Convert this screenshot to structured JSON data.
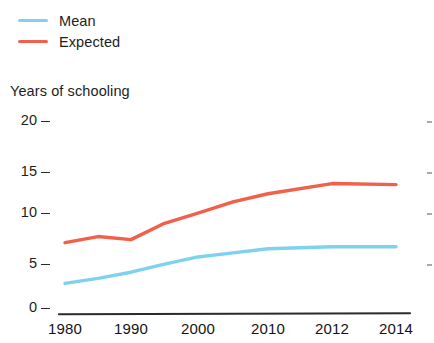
{
  "chart_data": {
    "type": "line",
    "title": "",
    "ylabel": "Years of schooling",
    "xlabel": "",
    "ylim": [
      0,
      20
    ],
    "yticks": [
      0,
      5,
      10,
      15,
      20
    ],
    "ytick_labels": [
      "0",
      "5",
      "10",
      "15",
      "20"
    ],
    "x": [
      1980,
      1985,
      1990,
      1995,
      2000,
      2005,
      2010,
      2012,
      2014
    ],
    "xticks": [
      1980,
      1990,
      2000,
      2010,
      2012,
      2014
    ],
    "xtick_labels": [
      "1980",
      "1990",
      "2000",
      "2010",
      "2012",
      "2014"
    ],
    "grid": false,
    "legend_position": "top-left",
    "series": [
      {
        "name": "Mean",
        "color": "#7ed2ee",
        "values": [
          3.0,
          3.5,
          4.1,
          4.9,
          5.6,
          6.0,
          6.4,
          6.6,
          6.6
        ]
      },
      {
        "name": "Expected",
        "color": "#f0604a",
        "values": [
          7.0,
          7.6,
          7.3,
          8.9,
          9.9,
          11.0,
          11.8,
          12.8,
          12.7
        ]
      }
    ]
  },
  "legend": {
    "items": [
      {
        "label": "Mean",
        "color": "#7ed2ee"
      },
      {
        "label": "Expected",
        "color": "#f0604a"
      }
    ]
  },
  "axes": {
    "y_title": "Years of schooling",
    "y_labels": [
      "20",
      "15",
      "10",
      "5",
      "0"
    ],
    "x_labels": [
      "1980",
      "1990",
      "2000",
      "2010",
      "2012",
      "2014"
    ]
  }
}
